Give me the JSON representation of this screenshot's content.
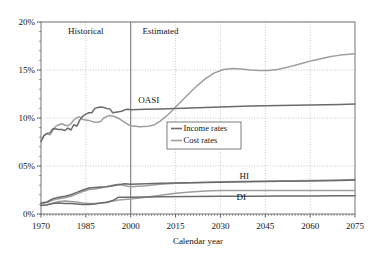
{
  "chart_data": {
    "type": "line",
    "title": "",
    "xlabel": "Calendar year",
    "ylabel": "",
    "xlim": [
      1970,
      2075
    ],
    "ylim": [
      0,
      20
    ],
    "grid": true,
    "legend_position": "center-left",
    "x_ticks": [
      "1970",
      "1985",
      "2000",
      "2015",
      "2030",
      "2045",
      "2060",
      "2075"
    ],
    "x_tick_values": [
      1970,
      1985,
      2000,
      2015,
      2030,
      2045,
      2060,
      2075
    ],
    "y_ticks": [
      "0%",
      "05%",
      "10%",
      "15%",
      "20%"
    ],
    "y_tick_values": [
      0,
      5,
      10,
      15,
      20
    ],
    "annotations": [
      {
        "text": "Historical",
        "x": 1985,
        "y": 18.7
      },
      {
        "text": "Estimated",
        "x": 2010,
        "y": 18.7
      },
      {
        "text": "OASI",
        "x": 2006,
        "y": 11.6
      },
      {
        "text": "HI",
        "x": 2038,
        "y": 3.6
      },
      {
        "text": "DI",
        "x": 2037,
        "y": 1.45
      }
    ],
    "divider_year": 2000,
    "legend": [
      {
        "name": "Income rates",
        "color": "#6b6b6b"
      },
      {
        "name": "Cost rates",
        "color": "#9e9e9e"
      }
    ],
    "series": [
      {
        "name": "OASI income rate",
        "program": "OASI",
        "kind": "income",
        "color": "#6b6b6b",
        "points": [
          [
            1970,
            7.55
          ],
          [
            1971,
            8.15
          ],
          [
            1972,
            8.4
          ],
          [
            1973,
            8.45
          ],
          [
            1974,
            8.9
          ],
          [
            1975,
            8.85
          ],
          [
            1976,
            8.8
          ],
          [
            1977,
            8.8
          ],
          [
            1978,
            8.7
          ],
          [
            1979,
            8.95
          ],
          [
            1980,
            8.75
          ],
          [
            1981,
            9.3
          ],
          [
            1982,
            9.15
          ],
          [
            1983,
            9.8
          ],
          [
            1984,
            10.2
          ],
          [
            1985,
            10.4
          ],
          [
            1986,
            10.55
          ],
          [
            1987,
            10.55
          ],
          [
            1988,
            11.0
          ],
          [
            1989,
            11.1
          ],
          [
            1990,
            11.15
          ],
          [
            1991,
            11.1
          ],
          [
            1992,
            11.0
          ],
          [
            1993,
            10.95
          ],
          [
            1994,
            10.55
          ],
          [
            1995,
            10.6
          ],
          [
            1996,
            10.65
          ],
          [
            1997,
            10.7
          ],
          [
            1998,
            10.85
          ],
          [
            1999,
            10.9
          ],
          [
            2000,
            10.85
          ],
          [
            2005,
            10.9
          ],
          [
            2010,
            10.95
          ],
          [
            2015,
            11.0
          ],
          [
            2020,
            11.05
          ],
          [
            2025,
            11.1
          ],
          [
            2030,
            11.15
          ],
          [
            2040,
            11.25
          ],
          [
            2050,
            11.3
          ],
          [
            2060,
            11.35
          ],
          [
            2070,
            11.4
          ],
          [
            2075,
            11.45
          ]
        ]
      },
      {
        "name": "OASI cost rate",
        "program": "OASI",
        "kind": "cost",
        "color": "#9e9e9e",
        "points": [
          [
            1970,
            7.6
          ],
          [
            1971,
            8.2
          ],
          [
            1972,
            8.35
          ],
          [
            1973,
            8.25
          ],
          [
            1974,
            8.75
          ],
          [
            1975,
            9.15
          ],
          [
            1976,
            9.3
          ],
          [
            1977,
            9.4
          ],
          [
            1978,
            9.25
          ],
          [
            1979,
            9.2
          ],
          [
            1980,
            9.4
          ],
          [
            1981,
            9.8
          ],
          [
            1982,
            10.05
          ],
          [
            1983,
            10.1
          ],
          [
            1984,
            9.85
          ],
          [
            1985,
            9.8
          ],
          [
            1986,
            9.75
          ],
          [
            1987,
            9.65
          ],
          [
            1988,
            9.55
          ],
          [
            1989,
            9.55
          ],
          [
            1990,
            9.65
          ],
          [
            1991,
            10.0
          ],
          [
            1992,
            10.15
          ],
          [
            1993,
            10.25
          ],
          [
            1994,
            10.2
          ],
          [
            1995,
            10.1
          ],
          [
            1996,
            9.95
          ],
          [
            1997,
            9.75
          ],
          [
            1998,
            9.55
          ],
          [
            1999,
            9.35
          ],
          [
            2000,
            9.2
          ],
          [
            2003,
            9.1
          ],
          [
            2006,
            9.15
          ],
          [
            2008,
            9.3
          ],
          [
            2010,
            9.7
          ],
          [
            2013,
            10.5
          ],
          [
            2016,
            11.45
          ],
          [
            2019,
            12.4
          ],
          [
            2022,
            13.3
          ],
          [
            2025,
            14.1
          ],
          [
            2028,
            14.7
          ],
          [
            2031,
            15.05
          ],
          [
            2034,
            15.15
          ],
          [
            2037,
            15.1
          ],
          [
            2040,
            15.0
          ],
          [
            2043,
            14.95
          ],
          [
            2046,
            14.95
          ],
          [
            2049,
            15.05
          ],
          [
            2052,
            15.25
          ],
          [
            2055,
            15.5
          ],
          [
            2058,
            15.75
          ],
          [
            2061,
            16.0
          ],
          [
            2064,
            16.2
          ],
          [
            2067,
            16.4
          ],
          [
            2070,
            16.55
          ],
          [
            2073,
            16.65
          ],
          [
            2075,
            16.7
          ]
        ]
      },
      {
        "name": "HI income rate",
        "program": "HI",
        "kind": "income",
        "color": "#6b6b6b",
        "points": [
          [
            1970,
            1.15
          ],
          [
            1972,
            1.25
          ],
          [
            1974,
            1.6
          ],
          [
            1976,
            1.75
          ],
          [
            1978,
            1.85
          ],
          [
            1980,
            2.0
          ],
          [
            1982,
            2.25
          ],
          [
            1984,
            2.5
          ],
          [
            1986,
            2.7
          ],
          [
            1988,
            2.75
          ],
          [
            1990,
            2.8
          ],
          [
            1992,
            2.85
          ],
          [
            1994,
            2.95
          ],
          [
            1996,
            3.05
          ],
          [
            1998,
            3.15
          ],
          [
            2000,
            3.1
          ],
          [
            2005,
            3.15
          ],
          [
            2010,
            3.2
          ],
          [
            2020,
            3.25
          ],
          [
            2030,
            3.3
          ],
          [
            2040,
            3.35
          ],
          [
            2050,
            3.4
          ],
          [
            2060,
            3.45
          ],
          [
            2070,
            3.5
          ],
          [
            2075,
            3.55
          ]
        ]
      },
      {
        "name": "HI cost rate",
        "program": "HI",
        "kind": "cost",
        "color": "#9e9e9e",
        "points": [
          [
            1970,
            1.1
          ],
          [
            1972,
            1.2
          ],
          [
            1974,
            1.45
          ],
          [
            1976,
            1.6
          ],
          [
            1978,
            1.7
          ],
          [
            1980,
            1.85
          ],
          [
            1982,
            2.1
          ],
          [
            1984,
            2.35
          ],
          [
            1986,
            2.55
          ],
          [
            1988,
            2.6
          ],
          [
            1990,
            2.7
          ],
          [
            1992,
            2.85
          ],
          [
            1994,
            3.0
          ],
          [
            1996,
            3.1
          ],
          [
            1998,
            2.95
          ],
          [
            2000,
            2.85
          ],
          [
            2005,
            2.95
          ],
          [
            2010,
            3.1
          ],
          [
            2015,
            3.2
          ],
          [
            2020,
            3.25
          ],
          [
            2025,
            3.3
          ],
          [
            2030,
            3.35
          ],
          [
            2040,
            3.4
          ],
          [
            2050,
            3.45
          ],
          [
            2060,
            3.5
          ],
          [
            2070,
            3.55
          ],
          [
            2075,
            3.6
          ]
        ]
      },
      {
        "name": "DI income rate",
        "program": "DI",
        "kind": "income",
        "color": "#6b6b6b",
        "points": [
          [
            1970,
            0.9
          ],
          [
            1972,
            0.95
          ],
          [
            1974,
            1.1
          ],
          [
            1976,
            1.15
          ],
          [
            1978,
            1.1
          ],
          [
            1980,
            1.1
          ],
          [
            1982,
            1.05
          ],
          [
            1984,
            1.0
          ],
          [
            1986,
            1.0
          ],
          [
            1988,
            1.05
          ],
          [
            1990,
            1.15
          ],
          [
            1992,
            1.2
          ],
          [
            1994,
            1.4
          ],
          [
            1996,
            1.75
          ],
          [
            1998,
            1.75
          ],
          [
            2000,
            1.75
          ],
          [
            2005,
            1.78
          ],
          [
            2010,
            1.8
          ],
          [
            2020,
            1.82
          ],
          [
            2030,
            1.85
          ],
          [
            2040,
            1.85
          ],
          [
            2050,
            1.88
          ],
          [
            2060,
            1.88
          ],
          [
            2070,
            1.9
          ],
          [
            2075,
            1.9
          ]
        ]
      },
      {
        "name": "DI cost rate",
        "program": "DI",
        "kind": "cost",
        "color": "#9e9e9e",
        "points": [
          [
            1970,
            0.85
          ],
          [
            1972,
            0.95
          ],
          [
            1974,
            1.15
          ],
          [
            1976,
            1.3
          ],
          [
            1978,
            1.35
          ],
          [
            1980,
            1.3
          ],
          [
            1982,
            1.25
          ],
          [
            1984,
            1.15
          ],
          [
            1986,
            1.1
          ],
          [
            1988,
            1.1
          ],
          [
            1990,
            1.15
          ],
          [
            1992,
            1.25
          ],
          [
            1994,
            1.35
          ],
          [
            1996,
            1.45
          ],
          [
            1998,
            1.5
          ],
          [
            2000,
            1.55
          ],
          [
            2005,
            1.75
          ],
          [
            2010,
            1.95
          ],
          [
            2015,
            2.15
          ],
          [
            2020,
            2.3
          ],
          [
            2025,
            2.4
          ],
          [
            2030,
            2.45
          ],
          [
            2040,
            2.45
          ],
          [
            2050,
            2.45
          ],
          [
            2060,
            2.45
          ],
          [
            2070,
            2.45
          ],
          [
            2075,
            2.45
          ]
        ]
      }
    ]
  }
}
